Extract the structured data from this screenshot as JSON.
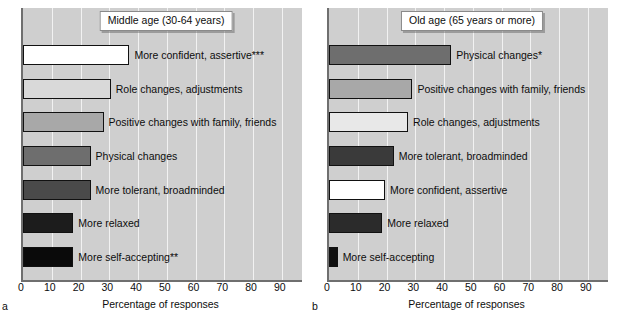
{
  "chart_data": [
    {
      "type": "bar",
      "orientation": "horizontal",
      "panel_letter": "a",
      "title": "Middle age (30-64 years)",
      "xlabel": "Percentage of responses",
      "ylabel": "",
      "xlim": [
        0,
        97
      ],
      "xticks": [
        0,
        10,
        20,
        30,
        40,
        50,
        60,
        70,
        80,
        90
      ],
      "grid": true,
      "grid_axis": "x",
      "categories": [
        "More confident, assertive***",
        "Role changes, adjustments",
        "Positive changes with family, friends",
        "Physical changes",
        "More tolerant, broadminded",
        "More relaxed",
        "More self-accepting**"
      ],
      "values": [
        37,
        30.5,
        28,
        23.5,
        23.5,
        17.5,
        17.5
      ],
      "bar_colors": [
        "#ffffff",
        "#d9d9d9",
        "#a8a8a8",
        "#6e6e6e",
        "#4a4a4a",
        "#1c1c1c",
        "#0a0a0a"
      ]
    },
    {
      "type": "bar",
      "orientation": "horizontal",
      "panel_letter": "b",
      "title": "Old age (65 years or more)",
      "xlabel": "Percentage of responses",
      "ylabel": "",
      "xlim": [
        0,
        97
      ],
      "xticks": [
        0,
        10,
        20,
        30,
        40,
        50,
        60,
        70,
        80,
        90
      ],
      "grid": true,
      "grid_axis": "x",
      "categories": [
        "Physical changes*",
        "Positive changes with family, friends",
        "Role changes, adjustments",
        "More tolerant, broadminded",
        "More confident, assertive",
        "More relaxed",
        "More self-accepting"
      ],
      "values": [
        42.5,
        29,
        27.5,
        22.5,
        19.5,
        18.5,
        3
      ],
      "bar_colors": [
        "#6e6e6e",
        "#a8a8a8",
        "#e8e8e8",
        "#3a3a3a",
        "#ffffff",
        "#2b2b2b",
        "#101010"
      ]
    }
  ],
  "panels": [
    {
      "letter": "a",
      "title": "Middle age (30-64 years)",
      "axis_title": "Percentage of responses",
      "ticks": [
        "0",
        "10",
        "20",
        "30",
        "40",
        "50",
        "60",
        "70",
        "80",
        "90"
      ],
      "bars": [
        {
          "label": "More confident, assertive***",
          "value": 37
        },
        {
          "label": "Role changes, adjustments",
          "value": 30.5
        },
        {
          "label": "Positive changes with family, friends",
          "value": 28
        },
        {
          "label": "Physical changes",
          "value": 23.5
        },
        {
          "label": "More tolerant, broadminded",
          "value": 23.5
        },
        {
          "label": "More relaxed",
          "value": 17.5
        },
        {
          "label": "More self-accepting**",
          "value": 17.5
        }
      ]
    },
    {
      "letter": "b",
      "title": "Old age (65 years or more)",
      "axis_title": "Percentage of responses",
      "ticks": [
        "0",
        "10",
        "20",
        "30",
        "40",
        "50",
        "60",
        "70",
        "80",
        "90"
      ],
      "bars": [
        {
          "label": "Physical changes*",
          "value": 42.5
        },
        {
          "label": "Positive changes with family, friends",
          "value": 29
        },
        {
          "label": "Role changes, adjustments",
          "value": 27.5
        },
        {
          "label": "More tolerant, broadminded",
          "value": 22.5
        },
        {
          "label": "More confident, assertive",
          "value": 19.5
        },
        {
          "label": "More relaxed",
          "value": 18.5
        },
        {
          "label": "More self-accepting",
          "value": 3
        }
      ]
    }
  ]
}
